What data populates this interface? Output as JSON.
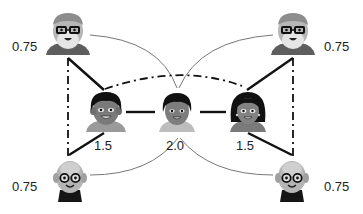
{
  "diagram": {
    "type": "social-network-graph",
    "nodes": [
      {
        "id": "elder-man-top-left",
        "kind": "elderly-man-glasses-beard",
        "weight_label": "0.75",
        "label_side": "left"
      },
      {
        "id": "elder-man-top-right",
        "kind": "elderly-man-glasses-beard",
        "weight_label": "0.75",
        "label_side": "right"
      },
      {
        "id": "boy-left",
        "kind": "young-man",
        "weight_label": "1.5",
        "label_side": "below"
      },
      {
        "id": "child-center",
        "kind": "child",
        "weight_label": "2.0",
        "label_side": "below"
      },
      {
        "id": "woman-right",
        "kind": "young-woman",
        "weight_label": "1.5",
        "label_side": "below"
      },
      {
        "id": "elder-bald-bottom-left",
        "kind": "elderly-bald-glasses",
        "weight_label": "0.75",
        "label_side": "left"
      },
      {
        "id": "elder-bald-bottom-right",
        "kind": "elderly-bald-glasses",
        "weight_label": "0.75",
        "label_side": "right"
      }
    ],
    "edges": [
      {
        "from": "elder-man-top-left",
        "to": "boy-left",
        "style": "solid-thick"
      },
      {
        "from": "elder-man-top-right",
        "to": "woman-right",
        "style": "solid-thick"
      },
      {
        "from": "boy-left",
        "to": "elder-bald-bottom-left",
        "style": "solid-thick"
      },
      {
        "from": "woman-right",
        "to": "elder-bald-bottom-right",
        "style": "solid-thick"
      },
      {
        "from": "boy-left",
        "to": "child-center",
        "style": "solid-thick"
      },
      {
        "from": "child-center",
        "to": "woman-right",
        "style": "solid-thick"
      },
      {
        "from": "boy-left",
        "to": "woman-right",
        "style": "dash-dot"
      },
      {
        "from": "elder-man-top-left",
        "to": "elder-bald-bottom-left",
        "style": "dash-dot"
      },
      {
        "from": "elder-man-top-right",
        "to": "elder-bald-bottom-right",
        "style": "dash-dot"
      },
      {
        "from": "elder-man-top-left",
        "to": "child-center",
        "style": "thin-curve"
      },
      {
        "from": "elder-man-top-right",
        "to": "child-center",
        "style": "thin-curve"
      },
      {
        "from": "elder-bald-bottom-left",
        "to": "child-center",
        "style": "thin-curve"
      },
      {
        "from": "elder-bald-bottom-right",
        "to": "child-center",
        "style": "thin-curve"
      }
    ],
    "colors": {
      "thick_edge": "#111111",
      "thin_edge": "#777777",
      "skin": "#8a8a8a",
      "light_skin": "#c8c8c8",
      "hair_dark": "#141414",
      "hair_grey": "#9a9a9a",
      "shirt": "#6a6a6a"
    }
  }
}
